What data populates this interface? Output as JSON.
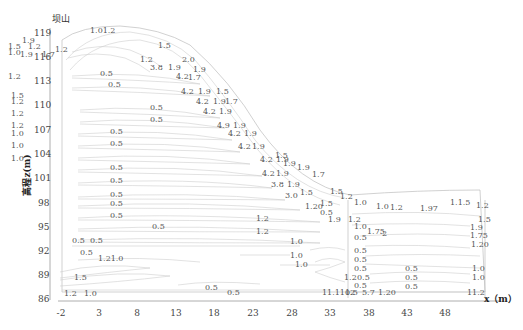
{
  "chart_data": {
    "type": "contour",
    "title": "",
    "corner_label": "坝山",
    "xlabel": "x（m）",
    "ylabel": "高程z(m)",
    "x_ticks": [
      "-2",
      "3",
      "8",
      "13",
      "18",
      "23",
      "28",
      "33",
      "38",
      "43",
      "48"
    ],
    "y_ticks": [
      "119",
      "116",
      "113",
      "110",
      "107",
      "104",
      "101",
      "98",
      "95",
      "92",
      "89",
      "86"
    ],
    "xlim": [
      -2,
      51
    ],
    "ylim": [
      85,
      120
    ],
    "grid": false,
    "legend": null,
    "contour_levels": [
      "0.5",
      "1.0",
      "1.2",
      "1.5",
      "1.7",
      "1.9",
      "2.0",
      "3.8",
      "4.2"
    ],
    "labels": [
      {
        "t": "1.01.2",
        "x": 90,
        "y": 33
      },
      {
        "t": "1.9",
        "x": 22,
        "y": 43
      },
      {
        "t": "1.5",
        "x": 8,
        "y": 49
      },
      {
        "t": "1.2",
        "x": 28,
        "y": 49
      },
      {
        "t": "1.0",
        "x": 8,
        "y": 55
      },
      {
        "t": "1.9",
        "x": 20,
        "y": 57
      },
      {
        "t": "1.7",
        "x": 42,
        "y": 57
      },
      {
        "t": "1.2",
        "x": 55,
        "y": 52
      },
      {
        "t": "1.5",
        "x": 158,
        "y": 48
      },
      {
        "t": "1.2",
        "x": 140,
        "y": 62
      },
      {
        "t": "3.8",
        "x": 150,
        "y": 70
      },
      {
        "t": "1.9",
        "x": 168,
        "y": 70
      },
      {
        "t": "2.0",
        "x": 182,
        "y": 62
      },
      {
        "t": "1.9",
        "x": 193,
        "y": 72
      },
      {
        "t": "0.5",
        "x": 100,
        "y": 76
      },
      {
        "t": "4.2",
        "x": 176,
        "y": 79
      },
      {
        "t": "1.7",
        "x": 188,
        "y": 80
      },
      {
        "t": "1.2",
        "x": 8,
        "y": 79
      },
      {
        "t": "0.5",
        "x": 108,
        "y": 87
      },
      {
        "t": "4.2",
        "x": 181,
        "y": 94
      },
      {
        "t": "1.9",
        "x": 198,
        "y": 94
      },
      {
        "t": "1.5",
        "x": 216,
        "y": 94
      },
      {
        "t": "1.5",
        "x": 11,
        "y": 98
      },
      {
        "t": "1.2",
        "x": 11,
        "y": 104
      },
      {
        "t": "4.2",
        "x": 196,
        "y": 104
      },
      {
        "t": "1.9",
        "x": 213,
        "y": 104
      },
      {
        "t": "1.7",
        "x": 225,
        "y": 104
      },
      {
        "t": "0.5",
        "x": 150,
        "y": 110
      },
      {
        "t": "4.2",
        "x": 203,
        "y": 114
      },
      {
        "t": "1.9",
        "x": 219,
        "y": 114
      },
      {
        "t": "1.2",
        "x": 11,
        "y": 116
      },
      {
        "t": "0.5",
        "x": 150,
        "y": 122
      },
      {
        "t": "1.2",
        "x": 11,
        "y": 128
      },
      {
        "t": "4.9",
        "x": 217,
        "y": 128
      },
      {
        "t": "1.9",
        "x": 233,
        "y": 128
      },
      {
        "t": "0.5",
        "x": 110,
        "y": 134
      },
      {
        "t": "1.0",
        "x": 11,
        "y": 136
      },
      {
        "t": "4.2",
        "x": 228,
        "y": 136
      },
      {
        "t": "1.9",
        "x": 244,
        "y": 136
      },
      {
        "t": "0.5",
        "x": 110,
        "y": 146
      },
      {
        "t": "1.0",
        "x": 11,
        "y": 148
      },
      {
        "t": "4.2",
        "x": 238,
        "y": 149
      },
      {
        "t": "1.9",
        "x": 252,
        "y": 149
      },
      {
        "t": "1.0",
        "x": 11,
        "y": 161
      },
      {
        "t": "1.5",
        "x": 275,
        "y": 158
      },
      {
        "t": "1.9",
        "x": 283,
        "y": 166
      },
      {
        "t": "1.9",
        "x": 297,
        "y": 170
      },
      {
        "t": "4.2",
        "x": 260,
        "y": 162
      },
      {
        "t": "1.9",
        "x": 276,
        "y": 162
      },
      {
        "t": "0.5",
        "x": 110,
        "y": 170
      },
      {
        "t": "4.2",
        "x": 262,
        "y": 176
      },
      {
        "t": "1.9",
        "x": 276,
        "y": 176
      },
      {
        "t": "1.7",
        "x": 312,
        "y": 177
      },
      {
        "t": "0.5",
        "x": 110,
        "y": 183
      },
      {
        "t": "3.8",
        "x": 271,
        "y": 187
      },
      {
        "t": "1.9",
        "x": 287,
        "y": 187
      },
      {
        "t": "3.0",
        "x": 285,
        "y": 198
      },
      {
        "t": "1.5",
        "x": 300,
        "y": 195
      },
      {
        "t": "1.5",
        "x": 330,
        "y": 194
      },
      {
        "t": "1.2",
        "x": 340,
        "y": 199
      },
      {
        "t": "0.5",
        "x": 110,
        "y": 197
      },
      {
        "t": "0.5",
        "x": 110,
        "y": 206
      },
      {
        "t": "1.20",
        "x": 305,
        "y": 209
      },
      {
        "t": "1.5",
        "x": 320,
        "y": 206
      },
      {
        "t": "0.5",
        "x": 320,
        "y": 215
      },
      {
        "t": "1.0",
        "x": 354,
        "y": 205
      },
      {
        "t": "1.0",
        "x": 376,
        "y": 209
      },
      {
        "t": "1.2",
        "x": 390,
        "y": 210
      },
      {
        "t": "1.97",
        "x": 420,
        "y": 211
      },
      {
        "t": "1.1.5",
        "x": 450,
        "y": 205
      },
      {
        "t": "1.2",
        "x": 476,
        "y": 208
      },
      {
        "t": "0.5",
        "x": 110,
        "y": 218
      },
      {
        "t": "1.2",
        "x": 256,
        "y": 221
      },
      {
        "t": "1.2",
        "x": 348,
        "y": 222
      },
      {
        "t": "1.9",
        "x": 328,
        "y": 222
      },
      {
        "t": "1.5",
        "x": 478,
        "y": 222
      },
      {
        "t": "1.0",
        "x": 354,
        "y": 229
      },
      {
        "t": "1.9",
        "x": 470,
        "y": 230
      },
      {
        "t": "0.5",
        "x": 152,
        "y": 229
      },
      {
        "t": "1.2",
        "x": 256,
        "y": 234
      },
      {
        "t": "1.75",
        "x": 367,
        "y": 234
      },
      {
        "t": "2",
        "x": 382,
        "y": 236
      },
      {
        "t": "1.75",
        "x": 470,
        "y": 238
      },
      {
        "t": "0.5",
        "x": 354,
        "y": 240
      },
      {
        "t": "0.5",
        "x": 72,
        "y": 243
      },
      {
        "t": "0.5",
        "x": 90,
        "y": 243
      },
      {
        "t": "1.0",
        "x": 290,
        "y": 244
      },
      {
        "t": "1.20",
        "x": 471,
        "y": 247
      },
      {
        "t": "0.5",
        "x": 354,
        "y": 253
      },
      {
        "t": "1.21.0",
        "x": 98,
        "y": 261
      },
      {
        "t": "0.5",
        "x": 80,
        "y": 255
      },
      {
        "t": "1.0",
        "x": 290,
        "y": 258
      },
      {
        "t": "0.5",
        "x": 354,
        "y": 262
      },
      {
        "t": "1.0",
        "x": 295,
        "y": 267
      },
      {
        "t": "0.5",
        "x": 354,
        "y": 271
      },
      {
        "t": "0.5",
        "x": 405,
        "y": 271
      },
      {
        "t": "1.0",
        "x": 472,
        "y": 271
      },
      {
        "t": "1.5",
        "x": 74,
        "y": 280
      },
      {
        "t": "1.2",
        "x": 344,
        "y": 280
      },
      {
        "t": "0.5",
        "x": 357,
        "y": 280
      },
      {
        "t": "0.5",
        "x": 405,
        "y": 280
      },
      {
        "t": "1.0",
        "x": 472,
        "y": 280
      },
      {
        "t": "0.5",
        "x": 354,
        "y": 288
      },
      {
        "t": "0.5",
        "x": 405,
        "y": 289
      },
      {
        "t": "0.5",
        "x": 205,
        "y": 290
      },
      {
        "t": "0.5",
        "x": 227,
        "y": 295
      },
      {
        "t": "1.2",
        "x": 64,
        "y": 296
      },
      {
        "t": "1.0",
        "x": 84,
        "y": 296
      },
      {
        "t": "11.1112",
        "x": 322,
        "y": 295
      },
      {
        "t": "0.5",
        "x": 345,
        "y": 295
      },
      {
        "t": "5.7",
        "x": 362,
        "y": 295
      },
      {
        "t": "1.20",
        "x": 378,
        "y": 295
      },
      {
        "t": "11.2",
        "x": 467,
        "y": 295
      }
    ]
  }
}
